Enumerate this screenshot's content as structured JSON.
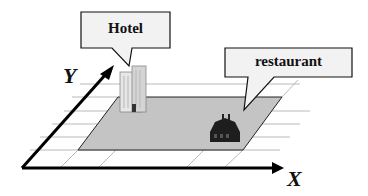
{
  "diagram": {
    "axes": {
      "x_label": "X",
      "y_label": "Y"
    },
    "callouts": [
      {
        "id": "hotel",
        "label": "Hotel"
      },
      {
        "id": "restaurant",
        "label": "restaurant"
      }
    ],
    "objects": [
      {
        "id": "hotel-building",
        "type": "building",
        "name": "Hotel"
      },
      {
        "id": "restaurant-building",
        "type": "building",
        "name": "restaurant"
      }
    ],
    "colors": {
      "shaded_region": "#c4c4c4",
      "callout_fill": "#f2f2f2",
      "axis": "#000000",
      "grid": "#9a9a9a"
    }
  }
}
